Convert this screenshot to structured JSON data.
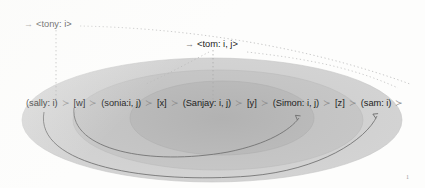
{
  "diagram": {
    "page_number": "1",
    "background_color": "#fdfdfc",
    "ellipse_colors": {
      "outer": "#cfcfcf",
      "middle": "#c2c2c2",
      "inner": "#b6b6b6"
    },
    "line_color": "#8a8a8a",
    "text_color": "#232323"
  },
  "annotations": [
    {
      "arrow": "→",
      "label": "<tony: i>",
      "name": "annotation-tony"
    },
    {
      "arrow": "→",
      "label": "<tom: i, j>",
      "name": "annotation-tom"
    }
  ],
  "chain": {
    "separator": "≻",
    "trailing_separator": "≻",
    "items": [
      {
        "text": "(sally: i)",
        "kind": "node"
      },
      {
        "text": "[w]",
        "kind": "edge"
      },
      {
        "text": "(sonia:i, j)",
        "kind": "node"
      },
      {
        "text": "[x]",
        "kind": "edge"
      },
      {
        "text": "(Sanjay: i, j)",
        "kind": "node"
      },
      {
        "text": "[y]",
        "kind": "edge"
      },
      {
        "text": "(Simon: i, j)",
        "kind": "node"
      },
      {
        "text": "[z]",
        "kind": "edge"
      },
      {
        "text": "(sam: i)",
        "kind": "node"
      }
    ]
  },
  "back_arrows": [
    {
      "name": "arc-to-simon",
      "from": "[w]",
      "to": "(Simon: i, j)"
    },
    {
      "name": "arc-to-sam",
      "from": "(sally: i)",
      "to": "(sam: i)"
    }
  ]
}
